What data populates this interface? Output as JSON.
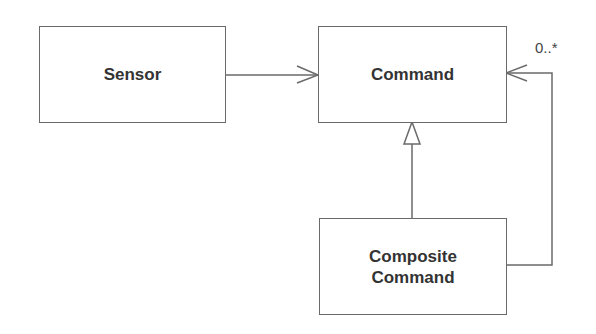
{
  "diagram": {
    "type": "UML class diagram",
    "classes": [
      {
        "id": "sensor",
        "label": "Sensor"
      },
      {
        "id": "command",
        "label": "Command"
      },
      {
        "id": "composite",
        "label": "Composite\nCommand"
      }
    ],
    "relationships": [
      {
        "from": "sensor",
        "to": "command",
        "kind": "association (navigable)"
      },
      {
        "from": "composite",
        "to": "command",
        "kind": "generalization"
      },
      {
        "from": "composite",
        "to": "command",
        "kind": "association (navigable)",
        "multiplicity": "0..*"
      }
    ],
    "multiplicity_label": "0..*",
    "colors": {
      "line": "#6a6a6a",
      "text": "#333333",
      "background": "#ffffff"
    }
  }
}
